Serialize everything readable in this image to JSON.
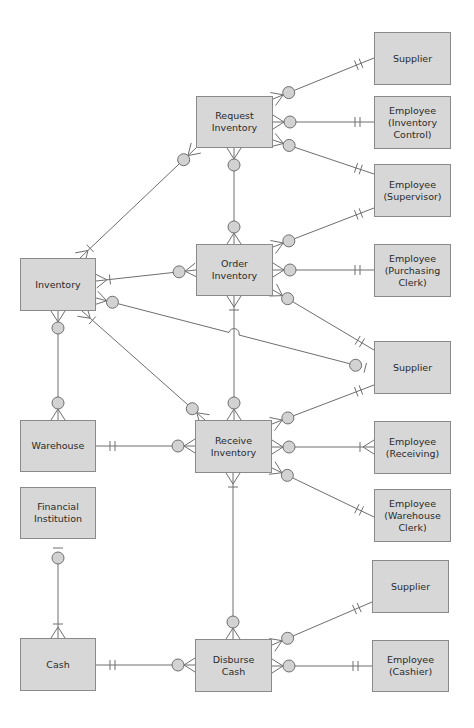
{
  "diagram": {
    "type": "entity-relationship (crow's foot)",
    "colors": {
      "entity_fill": "#d7d7d7",
      "entity_border": "#8a8a8a",
      "line": "#6e6e6e",
      "optional_circle": "#d2d2d2",
      "text": "#2a2a2a"
    },
    "entities": [
      {
        "id": "supplier1",
        "label": "Supplier",
        "x": 374,
        "y": 32,
        "w": 77,
        "h": 53
      },
      {
        "id": "request_inventory",
        "label": "Request\nInventory",
        "x": 196,
        "y": 96,
        "w": 77,
        "h": 52
      },
      {
        "id": "emp_inventory_control",
        "label": "Employee\n(Inventory\nControl)",
        "x": 374,
        "y": 96,
        "w": 77,
        "h": 53
      },
      {
        "id": "emp_supervisor",
        "label": "Employee\n(Supervisor)",
        "x": 374,
        "y": 164,
        "w": 77,
        "h": 53
      },
      {
        "id": "inventory",
        "label": "Inventory",
        "x": 20,
        "y": 258,
        "w": 76,
        "h": 53
      },
      {
        "id": "order_inventory",
        "label": "Order\nInventory",
        "x": 196,
        "y": 244,
        "w": 77,
        "h": 52
      },
      {
        "id": "emp_purchasing_clerk",
        "label": "Employee\n(Purchasing\nClerk)",
        "x": 374,
        "y": 244,
        "w": 77,
        "h": 53
      },
      {
        "id": "supplier2",
        "label": "Supplier",
        "x": 374,
        "y": 341,
        "w": 77,
        "h": 53
      },
      {
        "id": "warehouse",
        "label": "Warehouse",
        "x": 20,
        "y": 420,
        "w": 76,
        "h": 52
      },
      {
        "id": "receive_inventory",
        "label": "Receive\nInventory",
        "x": 195,
        "y": 420,
        "w": 77,
        "h": 53
      },
      {
        "id": "emp_receiving",
        "label": "Employee\n(Receiving)",
        "x": 374,
        "y": 421,
        "w": 77,
        "h": 53
      },
      {
        "id": "financial_institution",
        "label": "Financial\nInstitution",
        "x": 20,
        "y": 487,
        "w": 76,
        "h": 52
      },
      {
        "id": "emp_warehouse_clerk",
        "label": "Employee\n(Warehouse\nClerk)",
        "x": 374,
        "y": 489,
        "w": 77,
        "h": 53
      },
      {
        "id": "supplier3",
        "label": "Supplier",
        "x": 372,
        "y": 560,
        "w": 77,
        "h": 53
      },
      {
        "id": "cash",
        "label": "Cash",
        "x": 20,
        "y": 638,
        "w": 76,
        "h": 53
      },
      {
        "id": "disburse_cash",
        "label": "Disburse\nCash",
        "x": 195,
        "y": 639,
        "w": 77,
        "h": 53
      },
      {
        "id": "emp_cashier",
        "label": "Employee\n(Cashier)",
        "x": 372,
        "y": 640,
        "w": 77,
        "h": 52
      }
    ],
    "relationships": [
      {
        "from": "request_inventory",
        "to": "supplier1",
        "from_end": "zero-or-many",
        "to_end": "one-and-only-one",
        "pts": [
          [
            273,
            99
          ],
          [
            374,
            58
          ]
        ]
      },
      {
        "from": "request_inventory",
        "to": "emp_inventory_control",
        "from_end": "zero-or-many",
        "to_end": "one-and-only-one",
        "pts": [
          [
            273,
            122
          ],
          [
            374,
            122
          ]
        ]
      },
      {
        "from": "request_inventory",
        "to": "emp_supervisor",
        "from_end": "zero-or-many",
        "to_end": "one-and-only-one",
        "pts": [
          [
            273,
            140
          ],
          [
            374,
            174
          ]
        ]
      },
      {
        "from": "request_inventory",
        "to": "inventory",
        "from_end": "zero-or-many",
        "to_end": "one-or-many",
        "pts": [
          [
            196,
            148
          ],
          [
            80,
            258
          ]
        ]
      },
      {
        "from": "request_inventory",
        "to": "order_inventory",
        "from_end": "zero-or-many",
        "to_end": "zero-or-many",
        "pts": [
          [
            234,
            148
          ],
          [
            234,
            244
          ]
        ]
      },
      {
        "from": "order_inventory",
        "to": "emp_supervisor",
        "from_end": "zero-or-many",
        "to_end": "one-and-only-one",
        "pts": [
          [
            273,
            247
          ],
          [
            374,
            208
          ]
        ]
      },
      {
        "from": "order_inventory",
        "to": "emp_purchasing_clerk",
        "from_end": "zero-or-many",
        "to_end": "one-and-only-one",
        "pts": [
          [
            273,
            270
          ],
          [
            374,
            270
          ]
        ]
      },
      {
        "from": "order_inventory",
        "to": "supplier2",
        "from_end": "zero-or-many",
        "to_end": "one-and-only-one",
        "pts": [
          [
            273,
            290
          ],
          [
            374,
            350
          ]
        ]
      },
      {
        "from": "order_inventory",
        "to": "inventory",
        "from_end": "zero-or-many",
        "to_end": "one-or-many",
        "pts": [
          [
            196,
            270
          ],
          [
            96,
            281
          ]
        ]
      },
      {
        "from": "inventory",
        "to": "supplier2",
        "from_end": "zero-or-many",
        "to_end": "zero-or-one",
        "pts": [
          [
            96,
            298
          ],
          [
            374,
            370
          ]
        ],
        "jump_at": [
          234,
          335
        ]
      },
      {
        "from": "order_inventory",
        "to": "receive_inventory",
        "from_end": "one-or-many",
        "to_end": "zero-or-many",
        "pts": [
          [
            234,
            296
          ],
          [
            234,
            420
          ]
        ]
      },
      {
        "from": "inventory",
        "to": "receive_inventory",
        "from_end": "one-or-many",
        "to_end": "zero-or-many",
        "pts": [
          [
            82,
            311
          ],
          [
            205,
            420
          ]
        ]
      },
      {
        "from": "inventory",
        "to": "warehouse",
        "from_end": "zero-or-many",
        "to_end": "zero-or-many",
        "pts": [
          [
            58,
            311
          ],
          [
            58,
            420
          ]
        ]
      },
      {
        "from": "receive_inventory",
        "to": "supplier2",
        "from_end": "zero-or-many",
        "to_end": "one-and-only-one",
        "pts": [
          [
            272,
            424
          ],
          [
            374,
            385
          ]
        ]
      },
      {
        "from": "receive_inventory",
        "to": "emp_receiving",
        "from_end": "zero-or-many",
        "to_end": "one-or-many",
        "pts": [
          [
            272,
            447
          ],
          [
            374,
            447
          ]
        ]
      },
      {
        "from": "receive_inventory",
        "to": "emp_warehouse_clerk",
        "from_end": "zero-or-many",
        "to_end": "one-and-only-one",
        "pts": [
          [
            272,
            468
          ],
          [
            374,
            517
          ]
        ]
      },
      {
        "from": "warehouse",
        "to": "receive_inventory",
        "from_end": "one-and-only-one",
        "to_end": "zero-or-many",
        "pts": [
          [
            96,
            446
          ],
          [
            195,
            446
          ]
        ]
      },
      {
        "from": "receive_inventory",
        "to": "disburse_cash",
        "from_end": "one-or-many",
        "to_end": "zero-or-many",
        "pts": [
          [
            233,
            473
          ],
          [
            233,
            639
          ]
        ]
      },
      {
        "from": "financial_institution",
        "to": "cash",
        "from_end": "zero-or-one",
        "to_end": "one-or-many",
        "pts": [
          [
            58,
            539
          ],
          [
            58,
            638
          ]
        ]
      },
      {
        "from": "cash",
        "to": "disburse_cash",
        "from_end": "one-and-only-one",
        "to_end": "zero-or-many",
        "pts": [
          [
            96,
            665
          ],
          [
            195,
            665
          ]
        ]
      },
      {
        "from": "disburse_cash",
        "to": "supplier3",
        "from_end": "zero-or-many",
        "to_end": "one-and-only-one",
        "pts": [
          [
            272,
            645
          ],
          [
            372,
            602
          ]
        ]
      },
      {
        "from": "disburse_cash",
        "to": "emp_cashier",
        "from_end": "zero-or-many",
        "to_end": "one-and-only-one",
        "pts": [
          [
            272,
            666
          ],
          [
            372,
            666
          ]
        ]
      }
    ]
  }
}
